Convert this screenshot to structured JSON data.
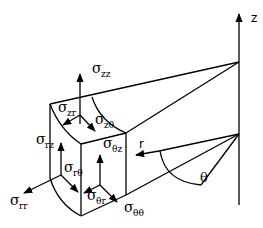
{
  "diagram": {
    "axis": {
      "label": "z"
    },
    "radius_label": "r",
    "angle_label": "θ",
    "stress_labels": [
      {
        "id": "zz",
        "sigma": "σ",
        "sub": "zz"
      },
      {
        "id": "zr",
        "sigma": "σ",
        "sub": "zr"
      },
      {
        "id": "ztheta",
        "sigma": "σ",
        "sub": "zθ"
      },
      {
        "id": "rz",
        "sigma": "σ",
        "sub": "rz"
      },
      {
        "id": "thetaz",
        "sigma": "σ",
        "sub": "θz"
      },
      {
        "id": "rtheta",
        "sigma": "σ",
        "sub": "rθ"
      },
      {
        "id": "rr",
        "sigma": "σ",
        "sub": "rr"
      },
      {
        "id": "thetar",
        "sigma": "σ",
        "sub": "θr"
      },
      {
        "id": "thetatheta",
        "sigma": "σ",
        "sub": "θθ"
      }
    ]
  }
}
